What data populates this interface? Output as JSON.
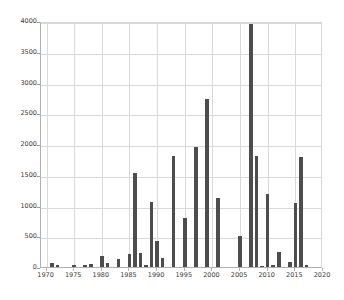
{
  "chart_data": {
    "type": "bar",
    "title": "",
    "subtitle": "",
    "xlabel": "",
    "ylabel": "",
    "xlim": [
      1969,
      2020
    ],
    "ylim": [
      0,
      4000
    ],
    "grid": true,
    "legend": false,
    "legend_position": "none",
    "bar_color": "#4d4d4d",
    "grid_color": "#d9d9d9",
    "axis_color": "#b0b0b0",
    "background_color": "#ffffff",
    "xticks": [
      1970,
      1975,
      1980,
      1985,
      1990,
      1995,
      2000,
      2005,
      2010,
      2015,
      2020
    ],
    "xtick_labels": [
      "1970",
      "1975",
      "1980",
      "1985",
      "1990",
      "1995",
      "2000",
      "2005",
      "2010",
      "2015",
      "2020"
    ],
    "yticks": [
      0,
      500,
      1000,
      1500,
      2000,
      2500,
      3000,
      3500,
      4000
    ],
    "ytick_labels": [
      "0",
      "500",
      "1000",
      "1500",
      "2000",
      "2500",
      "3000",
      "3500",
      "4000"
    ],
    "categories": [
      1970,
      1971,
      1972,
      1973,
      1974,
      1975,
      1976,
      1977,
      1978,
      1979,
      1980,
      1981,
      1982,
      1983,
      1984,
      1985,
      1986,
      1987,
      1988,
      1989,
      1990,
      1991,
      1992,
      1993,
      1994,
      1995,
      1996,
      1997,
      1998,
      1999,
      2000,
      2001,
      2002,
      2003,
      2004,
      2005,
      2006,
      2007,
      2008,
      2009,
      2010,
      2011,
      2012,
      2013,
      2014,
      2015,
      2016,
      2017
    ],
    "values": [
      0,
      60,
      25,
      0,
      0,
      30,
      0,
      35,
      55,
      0,
      180,
      60,
      0,
      130,
      0,
      205,
      1525,
      220,
      40,
      1065,
      425,
      150,
      0,
      1805,
      0,
      795,
      0,
      1955,
      0,
      2740,
      0,
      1120,
      0,
      0,
      0,
      510,
      0,
      3950,
      1805,
      20,
      1195,
      25,
      240,
      0,
      80,
      1040,
      1785,
      30
    ]
  }
}
